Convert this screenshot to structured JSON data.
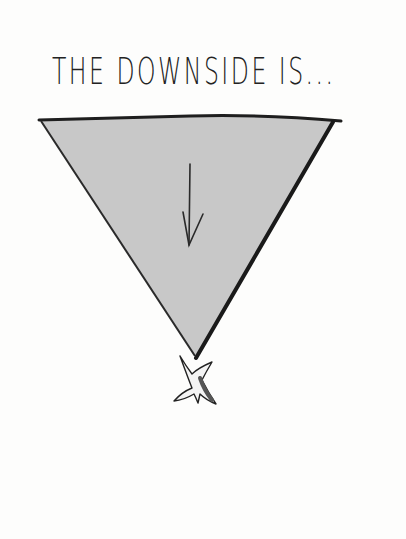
{
  "illustration": {
    "title": "THE DOWNSIDE IS...",
    "triangle": {
      "orientation": "inverted",
      "fill": "#c8c8c8",
      "stroke": "#1e1e1e"
    },
    "arrow": {
      "direction": "down",
      "color": "#2a2a2a"
    },
    "figure": {
      "description": "stick-figure-upside-down",
      "shade": "#555555"
    }
  }
}
